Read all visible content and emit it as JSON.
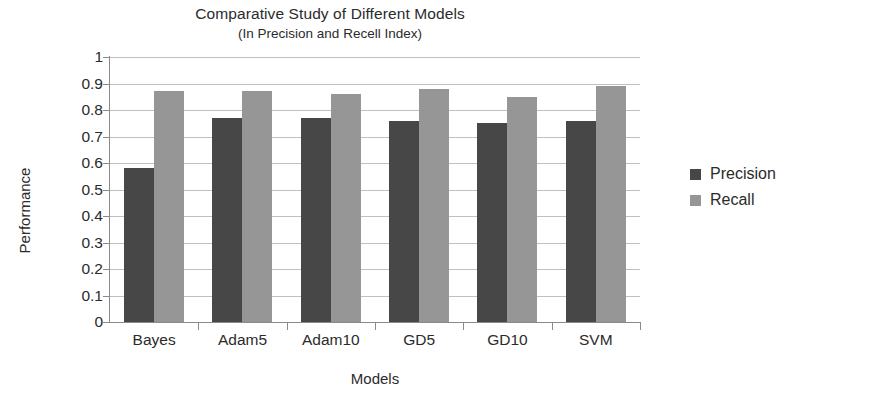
{
  "chart_data": {
    "type": "bar",
    "title": "Comparative Study of Different Models",
    "subtitle": "(In Precision and Recell Index)",
    "xlabel": "Models",
    "ylabel": "Performance",
    "ylim": [
      0,
      1
    ],
    "ytick_step": 0.1,
    "yticks": [
      "1",
      "0.9",
      "0.8",
      "0.7",
      "0.6",
      "0.5",
      "0.4",
      "0.3",
      "0.2",
      "0.1",
      "0"
    ],
    "ytick_values": [
      1,
      0.9,
      0.8,
      0.7,
      0.6,
      0.5,
      0.4,
      0.3,
      0.2,
      0.1,
      0
    ],
    "grid": true,
    "legend_position": "right",
    "categories": [
      "Bayes",
      "Adam5",
      "Adam10",
      "GD5",
      "GD10",
      "SVM"
    ],
    "series": [
      {
        "name": "Precision",
        "color": "#474747",
        "values": [
          0.58,
          0.77,
          0.77,
          0.76,
          0.75,
          0.76
        ]
      },
      {
        "name": "Recall",
        "color": "#969696",
        "values": [
          0.87,
          0.87,
          0.86,
          0.88,
          0.85,
          0.89
        ]
      }
    ]
  },
  "legend": {
    "items": [
      {
        "label": "Precision",
        "swatch": "precision"
      },
      {
        "label": "Recall",
        "swatch": "recall"
      }
    ]
  }
}
